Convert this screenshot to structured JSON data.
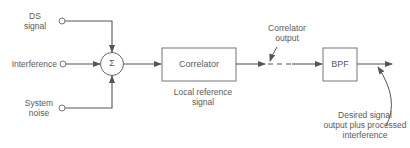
{
  "diagram": {
    "type": "block-diagram",
    "inputs": [
      {
        "id": "ds",
        "label_line1": "DS",
        "label_line2": "signal"
      },
      {
        "id": "interference",
        "label_line1": "Interference"
      },
      {
        "id": "noise",
        "label_line1": "System",
        "label_line2": "noise"
      }
    ],
    "summer": {
      "symbol": "Σ"
    },
    "blocks": {
      "correlator": {
        "label": "Correlator",
        "annotation_line1": "Local reference",
        "annotation_line2": "signal"
      },
      "bpf": {
        "label": "BPF"
      }
    },
    "annotations": {
      "correlator_output_line1": "Correlator",
      "correlator_output_line2": "output",
      "final_output_line1": "Desired signal",
      "final_output_line2": "output plus processed",
      "final_output_line3": "interference"
    },
    "colors": {
      "line": "#555555",
      "text": "#5a5a5a",
      "background": "#ffffff"
    }
  }
}
